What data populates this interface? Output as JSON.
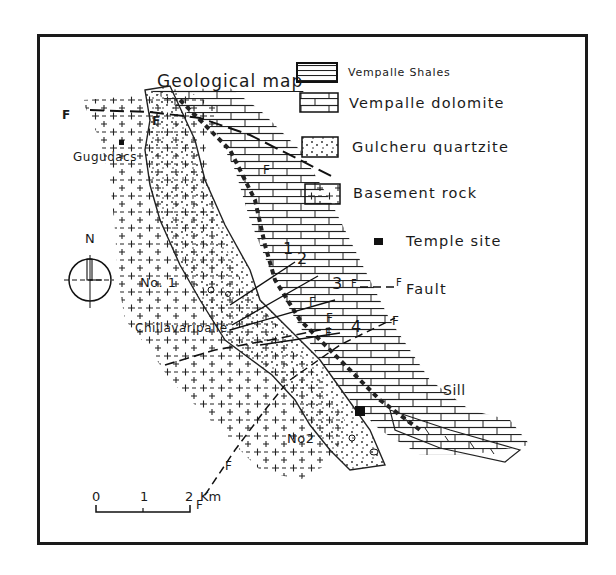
{
  "map": {
    "title": "Geological map",
    "legend": [
      {
        "label": "Vempalle Shales",
        "pattern": "horizontal-lines"
      },
      {
        "label": "Vempalle dolomite",
        "pattern": "brick"
      },
      {
        "label": "Gulcheru quartzite",
        "pattern": "dots"
      },
      {
        "label": "Basement rock",
        "pattern": "crosses"
      },
      {
        "label": "Temple site",
        "pattern": "black-square"
      }
    ],
    "fault_legend": {
      "symbol_left": "F",
      "symbol_right": "F",
      "label": "Fault"
    },
    "places": {
      "gugudacs": "Gugudacs",
      "chillavaripalle": "Chillavaripalle",
      "no1": "No. 1",
      "no2": "No2",
      "sill": "Sill"
    },
    "section_lines": [
      "1",
      "2",
      "3",
      "4"
    ],
    "fault_marks": [
      "F",
      "F",
      "F",
      "F",
      "F",
      "F",
      "F",
      "F",
      "F"
    ],
    "compass": {
      "north": "N"
    },
    "scale_bar": {
      "ticks": [
        "0",
        "1",
        "2"
      ],
      "unit": "Km"
    }
  }
}
